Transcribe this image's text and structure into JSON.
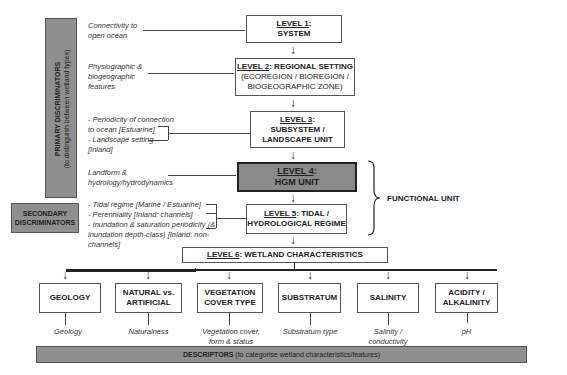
{
  "primary_discriminators": {
    "title": "PRIMARY DISCRIMINATORS",
    "subtitle": "(to distinguish between wetland types)"
  },
  "secondary_discriminators": {
    "line1": "SECONDARY",
    "line2": "DISCRIMINATORS"
  },
  "levels": [
    {
      "label": "LEVEL 1",
      "title": "SYSTEM",
      "note": [
        "Connectivity to",
        "open ocean"
      ]
    },
    {
      "label": "LEVEL 2",
      "title": "REGIONAL SETTING",
      "subtitle": [
        "(ECOREGION / BIOREGION /",
        "BIOGEOGRAPHIC ZONE)"
      ],
      "note": [
        "Physiographic &",
        "biogeographic",
        "features"
      ]
    },
    {
      "label": "LEVEL 3",
      "title": [
        "SUBSYSTEM /",
        "LANDSCAPE UNIT"
      ],
      "note": [
        "- Periodicity of connection",
        "to ocean [Estuarine]",
        "- Landscape setting",
        "[Inland]"
      ]
    },
    {
      "label": "LEVEL 4",
      "title": "HGM UNIT",
      "note": [
        "Landform &",
        "hydrology/hydrodynamics"
      ]
    },
    {
      "label": "LEVEL 5",
      "title": [
        "TIDAL /",
        "HYDROLOGICAL REGIME"
      ],
      "note": [
        "- Tidal regime [Marine / Estuarine]",
        "- Perenniality [Inland: channels]",
        "- Inundation & saturation periodicity (&",
        "inundation depth-class) [Inland: non-",
        "channels]"
      ]
    },
    {
      "label": "LEVEL 6",
      "title": "WETLAND CHARACTERISTICS"
    }
  ],
  "functional_unit": "FUNCTIONAL UNIT",
  "characteristics": [
    {
      "title": [
        "GEOLOGY"
      ],
      "descriptor": [
        "Geology"
      ]
    },
    {
      "title": [
        "NATURAL vs.",
        "ARTIFICIAL"
      ],
      "descriptor": [
        "Naturalness"
      ]
    },
    {
      "title": [
        "VEGETATION",
        "COVER TYPE"
      ],
      "descriptor": [
        "Vegetation cover,",
        "form & status"
      ]
    },
    {
      "title": [
        "SUBSTRATUM"
      ],
      "descriptor": [
        "Substratum type"
      ]
    },
    {
      "title": [
        "SALINITY"
      ],
      "descriptor": [
        "Salinity /",
        "conductivity"
      ]
    },
    {
      "title": [
        "ACIDITY /",
        "ALKALINITY"
      ],
      "descriptor": [
        "pH"
      ]
    }
  ],
  "descriptors_bar": {
    "title": "DESCRIPTORS",
    "subtitle": "(to categorise wetland characteristics/features)"
  }
}
